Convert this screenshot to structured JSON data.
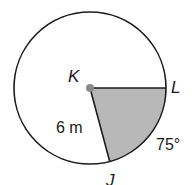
{
  "diagram": {
    "type": "circle-sector",
    "center_label": "K",
    "point_labels": {
      "L": "L",
      "J": "J"
    },
    "radius_label": "6 m",
    "arc_label": "75°",
    "colors": {
      "stroke": "#1a1a1a",
      "sector_fill": "#b8b8b8",
      "center_dot": "#8a8a8a"
    }
  }
}
